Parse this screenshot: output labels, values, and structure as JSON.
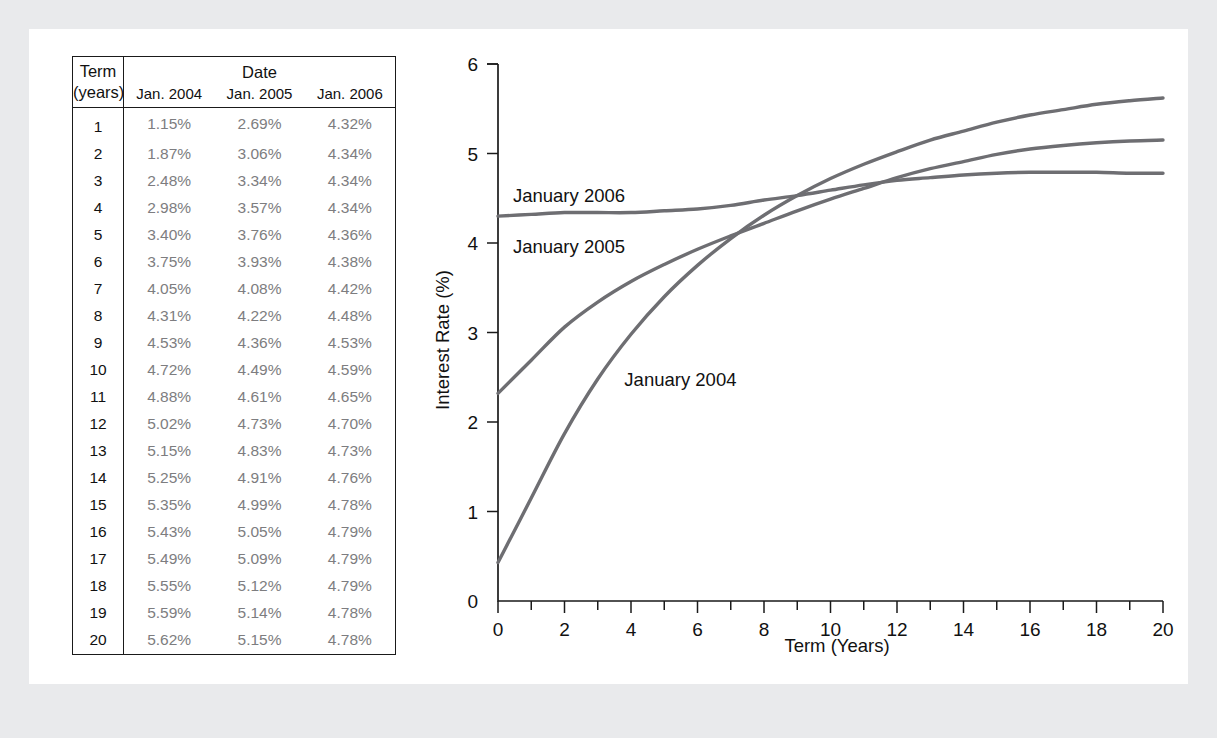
{
  "figure": {
    "panel_bg": "#ffffff",
    "outer_bg": "#e9eaec"
  },
  "table": {
    "term_header_line1": "Term",
    "term_header_line2": "(years)",
    "date_header": "Date",
    "column_headers": [
      "Jan. 2004",
      "Jan. 2005",
      "Jan. 2006"
    ],
    "rows": [
      {
        "term": "1",
        "jan2004": "1.15%",
        "jan2005": "2.69%",
        "jan2006": "4.32%"
      },
      {
        "term": "2",
        "jan2004": "1.87%",
        "jan2005": "3.06%",
        "jan2006": "4.34%"
      },
      {
        "term": "3",
        "jan2004": "2.48%",
        "jan2005": "3.34%",
        "jan2006": "4.34%"
      },
      {
        "term": "4",
        "jan2004": "2.98%",
        "jan2005": "3.57%",
        "jan2006": "4.34%"
      },
      {
        "term": "5",
        "jan2004": "3.40%",
        "jan2005": "3.76%",
        "jan2006": "4.36%"
      },
      {
        "term": "6",
        "jan2004": "3.75%",
        "jan2005": "3.93%",
        "jan2006": "4.38%"
      },
      {
        "term": "7",
        "jan2004": "4.05%",
        "jan2005": "4.08%",
        "jan2006": "4.42%"
      },
      {
        "term": "8",
        "jan2004": "4.31%",
        "jan2005": "4.22%",
        "jan2006": "4.48%"
      },
      {
        "term": "9",
        "jan2004": "4.53%",
        "jan2005": "4.36%",
        "jan2006": "4.53%"
      },
      {
        "term": "10",
        "jan2004": "4.72%",
        "jan2005": "4.49%",
        "jan2006": "4.59%"
      },
      {
        "term": "11",
        "jan2004": "4.88%",
        "jan2005": "4.61%",
        "jan2006": "4.65%"
      },
      {
        "term": "12",
        "jan2004": "5.02%",
        "jan2005": "4.73%",
        "jan2006": "4.70%"
      },
      {
        "term": "13",
        "jan2004": "5.15%",
        "jan2005": "4.83%",
        "jan2006": "4.73%"
      },
      {
        "term": "14",
        "jan2004": "5.25%",
        "jan2005": "4.91%",
        "jan2006": "4.76%"
      },
      {
        "term": "15",
        "jan2004": "5.35%",
        "jan2005": "4.99%",
        "jan2006": "4.78%"
      },
      {
        "term": "16",
        "jan2004": "5.43%",
        "jan2005": "5.05%",
        "jan2006": "4.79%"
      },
      {
        "term": "17",
        "jan2004": "5.49%",
        "jan2005": "5.09%",
        "jan2006": "4.79%"
      },
      {
        "term": "18",
        "jan2004": "5.55%",
        "jan2005": "5.12%",
        "jan2006": "4.79%"
      },
      {
        "term": "19",
        "jan2004": "5.59%",
        "jan2005": "5.14%",
        "jan2006": "4.78%"
      },
      {
        "term": "20",
        "jan2004": "5.62%",
        "jan2005": "5.15%",
        "jan2006": "4.78%"
      }
    ]
  },
  "chart_data": {
    "type": "line",
    "title": "",
    "xlabel": "Term (Years)",
    "ylabel": "Interest Rate (%)",
    "xlim": [
      0,
      20
    ],
    "ylim": [
      0,
      6
    ],
    "xticks": [
      0,
      2,
      4,
      6,
      8,
      10,
      12,
      14,
      16,
      18,
      20
    ],
    "xtick_labels": [
      "0",
      "2",
      "4",
      "6",
      "8",
      "10",
      "12",
      "14",
      "16",
      "18",
      "20"
    ],
    "xminor_step": 1,
    "yticks": [
      0,
      1,
      2,
      3,
      4,
      5,
      6
    ],
    "ytick_labels": [
      "0",
      "1",
      "2",
      "3",
      "4",
      "5",
      "6"
    ],
    "grid": false,
    "legend": "inline-labels",
    "line_color": "#6e6e72",
    "x": [
      1,
      2,
      3,
      4,
      5,
      6,
      7,
      8,
      9,
      10,
      11,
      12,
      13,
      14,
      15,
      16,
      17,
      18,
      19,
      20
    ],
    "series": [
      {
        "name": "January 2004",
        "label": "January 2004",
        "label_x": 3.8,
        "label_y": 2.47,
        "values": [
          1.15,
          1.87,
          2.48,
          2.98,
          3.4,
          3.75,
          4.05,
          4.31,
          4.53,
          4.72,
          4.88,
          5.02,
          5.15,
          5.25,
          5.35,
          5.43,
          5.49,
          5.55,
          5.59,
          5.62
        ]
      },
      {
        "name": "January 2005",
        "label": "January 2005",
        "label_x": 0.45,
        "label_y": 3.96,
        "values": [
          2.69,
          3.06,
          3.34,
          3.57,
          3.76,
          3.93,
          4.08,
          4.22,
          4.36,
          4.49,
          4.61,
          4.73,
          4.83,
          4.91,
          4.99,
          5.05,
          5.09,
          5.12,
          5.14,
          5.15
        ]
      },
      {
        "name": "January 2006",
        "label": "January 2006",
        "label_x": 0.45,
        "label_y": 4.52,
        "values": [
          4.32,
          4.34,
          4.34,
          4.34,
          4.36,
          4.38,
          4.42,
          4.48,
          4.53,
          4.59,
          4.65,
          4.7,
          4.73,
          4.76,
          4.78,
          4.79,
          4.79,
          4.79,
          4.78,
          4.78
        ]
      }
    ]
  }
}
